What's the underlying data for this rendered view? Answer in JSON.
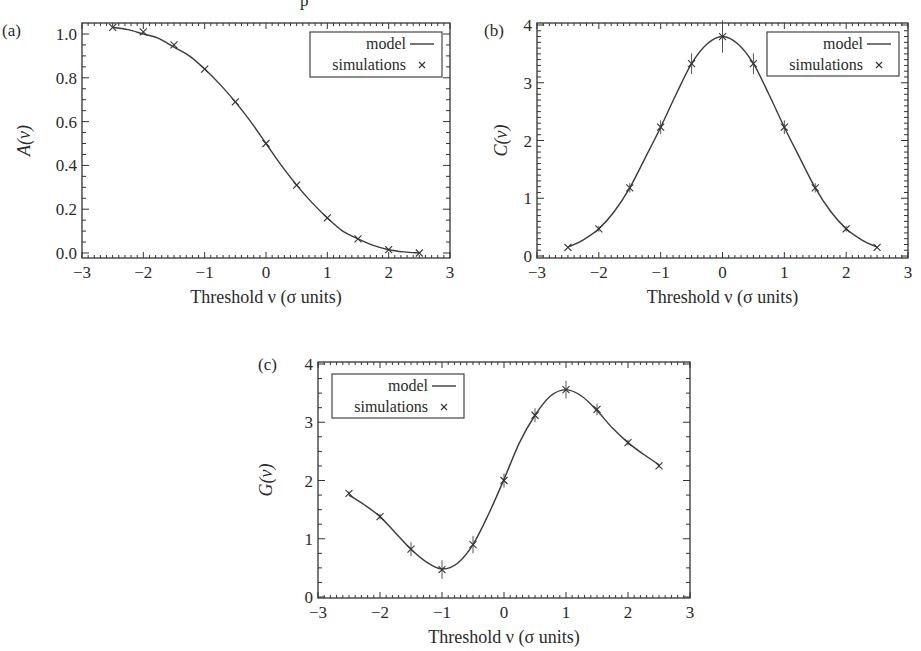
{
  "figure": {
    "top_fragment": "p",
    "x_axis_title": "Threshold ν (σ units)"
  },
  "legend": {
    "model_label": "model",
    "simulations_label": "simulations"
  },
  "chart_data": [
    {
      "id": "a",
      "panel_label": "(a)",
      "type": "line",
      "title": "",
      "xlabel": "Threshold ν (σ units)",
      "ylabel": "A(ν)",
      "xlim": [
        -3,
        3
      ],
      "ylim": [
        -0.02,
        1.03
      ],
      "xticks": [
        -3,
        -2,
        -1,
        0,
        1,
        2,
        3
      ],
      "xtick_labels": [
        "−3",
        "−2",
        "−1",
        "0",
        "1",
        "2",
        "3"
      ],
      "yticks": [
        0.0,
        0.2,
        0.4,
        0.6,
        0.8,
        1.0
      ],
      "ytick_labels": [
        "0.0",
        "0.2",
        "0.4",
        "0.6",
        "0.8",
        "1.0"
      ],
      "legend_position": "upper right",
      "grid": false,
      "series": [
        {
          "name": "model",
          "style": "line",
          "x": [
            -2.5,
            -2.25,
            -2.0,
            -1.75,
            -1.5,
            -1.25,
            -1.0,
            -0.75,
            -0.5,
            -0.25,
            0.0,
            0.25,
            0.5,
            0.75,
            1.0,
            1.25,
            1.5,
            1.75,
            2.0,
            2.25,
            2.5
          ],
          "values": [
            1.03,
            1.02,
            1.0,
            0.98,
            0.94,
            0.9,
            0.84,
            0.77,
            0.69,
            0.6,
            0.5,
            0.4,
            0.31,
            0.23,
            0.16,
            0.1,
            0.065,
            0.035,
            0.015,
            0.005,
            0.0
          ]
        },
        {
          "name": "simulations",
          "style": "x-marker",
          "x": [
            -2.5,
            -2.0,
            -1.5,
            -1.0,
            -0.5,
            0.0,
            0.5,
            1.0,
            1.5,
            2.0,
            2.5
          ],
          "values": [
            1.03,
            1.01,
            0.95,
            0.84,
            0.69,
            0.5,
            0.31,
            0.16,
            0.065,
            0.015,
            0.0
          ],
          "errors": [
            0,
            0,
            0,
            0,
            0,
            0,
            0,
            0,
            0,
            0,
            0
          ]
        }
      ]
    },
    {
      "id": "b",
      "panel_label": "(b)",
      "type": "line",
      "title": "",
      "xlabel": "Threshold ν (σ units)",
      "ylabel": "C(ν)",
      "xlim": [
        -3,
        3
      ],
      "ylim": [
        0,
        4.05
      ],
      "xticks": [
        -3,
        -2,
        -1,
        0,
        1,
        2,
        3
      ],
      "xtick_labels": [
        "−3",
        "−2",
        "−1",
        "0",
        "1",
        "2",
        "3"
      ],
      "yticks": [
        0,
        1,
        2,
        3,
        4
      ],
      "ytick_labels": [
        "0",
        "1",
        "2",
        "3",
        "4"
      ],
      "legend_position": "upper right",
      "grid": false,
      "series": [
        {
          "name": "model",
          "style": "line",
          "x": [
            -2.5,
            -2.25,
            -2.0,
            -1.75,
            -1.5,
            -1.25,
            -1.0,
            -0.75,
            -0.5,
            -0.25,
            0.0,
            0.25,
            0.5,
            0.75,
            1.0,
            1.25,
            1.5,
            1.75,
            2.0,
            2.25,
            2.5
          ],
          "values": [
            0.15,
            0.28,
            0.47,
            0.77,
            1.18,
            1.7,
            2.23,
            2.8,
            3.33,
            3.67,
            3.8,
            3.67,
            3.33,
            2.8,
            2.23,
            1.7,
            1.18,
            0.77,
            0.47,
            0.28,
            0.15
          ]
        },
        {
          "name": "simulations",
          "style": "x-marker",
          "x": [
            -2.5,
            -2.0,
            -1.5,
            -1.0,
            -0.5,
            0.0,
            0.5,
            1.0,
            1.5,
            2.0,
            2.5
          ],
          "values": [
            0.15,
            0.47,
            1.18,
            2.23,
            3.33,
            3.8,
            3.33,
            2.23,
            1.18,
            0.47,
            0.15
          ],
          "errors": [
            0.0,
            0.05,
            0.08,
            0.12,
            0.18,
            0.28,
            0.18,
            0.12,
            0.08,
            0.05,
            0.0
          ]
        }
      ]
    },
    {
      "id": "c",
      "panel_label": "(c)",
      "type": "line",
      "title": "",
      "xlabel": "Threshold ν (σ units)",
      "ylabel": "G(ν)",
      "xlim": [
        -3,
        3
      ],
      "ylim": [
        0,
        4.03
      ],
      "xticks": [
        -3,
        -2,
        -1,
        0,
        1,
        2,
        3
      ],
      "xtick_labels": [
        "−3",
        "−2",
        "−1",
        "0",
        "1",
        "2",
        "3"
      ],
      "yticks": [
        0,
        1,
        2,
        3,
        4
      ],
      "ytick_labels": [
        "0",
        "1",
        "2",
        "3",
        "4"
      ],
      "legend_position": "upper left",
      "grid": false,
      "series": [
        {
          "name": "model",
          "style": "line",
          "x": [
            -2.5,
            -2.25,
            -2.0,
            -1.75,
            -1.5,
            -1.25,
            -1.0,
            -0.75,
            -0.5,
            -0.25,
            0.0,
            0.25,
            0.5,
            0.75,
            1.0,
            1.25,
            1.5,
            1.75,
            2.0,
            2.25,
            2.5
          ],
          "values": [
            1.75,
            1.58,
            1.38,
            1.1,
            0.82,
            0.6,
            0.48,
            0.58,
            0.9,
            1.42,
            2.02,
            2.65,
            3.12,
            3.45,
            3.56,
            3.45,
            3.2,
            2.9,
            2.65,
            2.45,
            2.27
          ]
        },
        {
          "name": "simulations",
          "style": "x-marker",
          "x": [
            -2.5,
            -2.0,
            -1.5,
            -1.0,
            -0.5,
            0.0,
            0.5,
            1.0,
            1.5,
            2.0,
            2.5
          ],
          "values": [
            1.78,
            1.38,
            0.82,
            0.47,
            0.9,
            2.0,
            3.12,
            3.56,
            3.22,
            2.65,
            2.25
          ],
          "errors": [
            0.03,
            0.05,
            0.12,
            0.16,
            0.15,
            0.12,
            0.12,
            0.15,
            0.1,
            0.05,
            0.03
          ]
        }
      ]
    }
  ]
}
